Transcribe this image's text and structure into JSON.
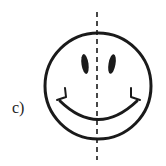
{
  "figure": {
    "label": "c)",
    "stroke_color": "#1a1a1a",
    "symmetry_line": {
      "style": "dashed",
      "orientation": "vertical"
    }
  }
}
